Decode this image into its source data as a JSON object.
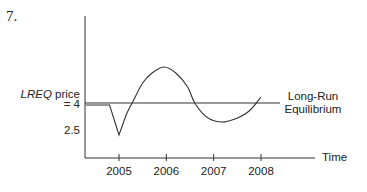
{
  "problem_number": "7.",
  "chart_data": {
    "type": "line",
    "title": "",
    "xlabel": "Time",
    "ylabel_italic": "LREQ",
    "ylabel_rest": " price",
    "y_tick_labels": [
      {
        "value": 4,
        "label": "= 4"
      },
      {
        "value": 2.5,
        "label": "2.5"
      }
    ],
    "x_ticks": [
      2005,
      2006,
      2007,
      2008
    ],
    "x_tick_labels": [
      "2005",
      "2006",
      "2007",
      "2008"
    ],
    "xlim": [
      2004.3,
      2009.4
    ],
    "ylim": [
      1.0,
      8.8
    ],
    "equilibrium": {
      "value": 4,
      "label_line1": "Long-Run",
      "label_line2": "Equilibrium",
      "x_end": 2009.2
    },
    "series": [
      {
        "name": "price",
        "points": [
          [
            2004.3,
            3.9
          ],
          [
            2004.8,
            3.9
          ],
          [
            2005.0,
            2.4
          ],
          [
            2005.15,
            3.4
          ],
          [
            2005.3,
            4.1
          ],
          [
            2005.5,
            5.0
          ],
          [
            2005.7,
            5.5
          ],
          [
            2005.95,
            5.8
          ],
          [
            2006.2,
            5.5
          ],
          [
            2006.45,
            4.8
          ],
          [
            2006.6,
            4.0
          ],
          [
            2006.85,
            3.3
          ],
          [
            2007.15,
            3.05
          ],
          [
            2007.45,
            3.2
          ],
          [
            2007.75,
            3.6
          ],
          [
            2008.0,
            4.3
          ]
        ]
      }
    ]
  }
}
